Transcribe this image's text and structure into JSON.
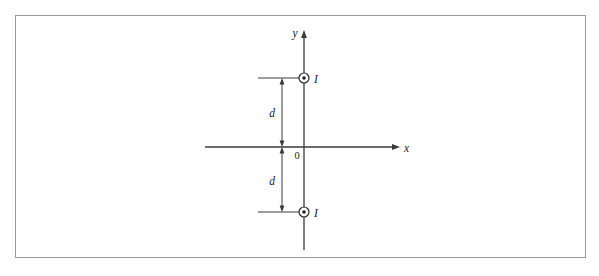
{
  "figure": {
    "background_color": "#ffffff",
    "border": {
      "color": "#9a9a9a",
      "x": 15,
      "y": 15,
      "width": 570,
      "height": 242,
      "stroke_width": 1
    },
    "line_color": "#3a3a3a",
    "text_color": "#1a1a1a",
    "axes": {
      "x_axis": {
        "label": "x",
        "start_x": 205,
        "end_x": 400,
        "y": 147,
        "label_x": 404,
        "label_y": 152
      },
      "y_axis": {
        "label": "y",
        "x": 304,
        "start_y": 250,
        "end_y": 30,
        "label_x": 295,
        "label_y": 37
      },
      "origin": {
        "label": "0",
        "x": 304,
        "y": 147,
        "label_x": 297,
        "label_y": 159
      }
    },
    "currents": [
      {
        "label": "I",
        "symbol": "current-out-of-page",
        "cx": 304,
        "cy": 78,
        "outer_radius": 5,
        "dot_radius": 1.7,
        "label_x": 314,
        "label_y": 83,
        "extension_line": {
          "x1": 258,
          "x2": 300,
          "y": 78
        }
      },
      {
        "label": "I",
        "symbol": "current-out-of-page",
        "cx": 304,
        "cy": 212,
        "outer_radius": 5,
        "dot_radius": 1.7,
        "label_x": 314,
        "label_y": 217,
        "extension_line": {
          "x1": 258,
          "x2": 300,
          "y": 212
        }
      }
    ],
    "dimensions": [
      {
        "label": "d",
        "name": "distance-upper",
        "x": 282,
        "y_top": 78,
        "y_bottom": 147,
        "label_x": 272,
        "label_y": 117
      },
      {
        "label": "d",
        "name": "distance-lower",
        "x": 282,
        "y_top": 147,
        "y_bottom": 212,
        "label_x": 272,
        "label_y": 185
      }
    ]
  }
}
